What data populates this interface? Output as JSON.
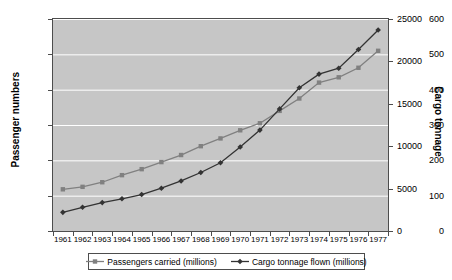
{
  "chart_data": {
    "type": "line",
    "title": "",
    "xlabel": "",
    "ylabel": "Passenger numbers",
    "y2label": "Cargo tonnage",
    "grid": true,
    "legend_position": "bottom",
    "categories": [
      "1961",
      "1962",
      "1963",
      "1964",
      "1965",
      "1966",
      "1967",
      "1968",
      "1969",
      "1970",
      "1971",
      "1972",
      "1973",
      "1974",
      "1975",
      "1976",
      "1977"
    ],
    "ylim": [
      0,
      600
    ],
    "yticks": [
      0,
      100,
      200,
      300,
      400,
      500,
      600
    ],
    "y2lim": [
      0,
      25000
    ],
    "y2ticks": [
      0,
      5000,
      10000,
      15000,
      20000,
      25000
    ],
    "series": [
      {
        "name": "Passengers carried (millions)",
        "axis": "left",
        "color": "#808080",
        "marker": "square",
        "values": [
          118,
          125,
          138,
          158,
          175,
          195,
          215,
          240,
          262,
          285,
          305,
          340,
          375,
          420,
          435,
          462,
          510
        ]
      },
      {
        "name": "Cargo tonnage flown (millions)",
        "axis": "right",
        "color": "#333333",
        "marker": "diamond",
        "values": [
          2200,
          2800,
          3350,
          3800,
          4300,
          5050,
          5900,
          6900,
          8050,
          9900,
          11900,
          14400,
          16900,
          18500,
          19200,
          21400,
          23700
        ]
      }
    ]
  },
  "axes": {
    "left_title": "Passenger numbers",
    "right_title": "Cargo tonnage",
    "left_ticks": [
      "0",
      "100",
      "200",
      "300",
      "400",
      "500",
      "600"
    ],
    "right_ticks": [
      "0",
      "5000",
      "10000",
      "15000",
      "20000",
      "25000"
    ],
    "x_ticks": [
      "1961",
      "1962",
      "1963",
      "1964",
      "1965",
      "1966",
      "1967",
      "1968",
      "1969",
      "1970",
      "1971",
      "1972",
      "1973",
      "1974",
      "1975",
      "1976",
      "1977"
    ]
  },
  "legend": {
    "items": [
      {
        "label": "Passengers carried (millions)",
        "color": "#808080",
        "marker": "square"
      },
      {
        "label": "Cargo tonnage flown (millions)",
        "color": "#333333",
        "marker": "diamond"
      }
    ]
  },
  "colors": {
    "plot_background": "#c6c6c6",
    "gridline": "#ffffff",
    "axis": "#4d4d4d",
    "page_background": "#ffffff",
    "series_passengers": "#808080",
    "series_cargo": "#333333"
  }
}
